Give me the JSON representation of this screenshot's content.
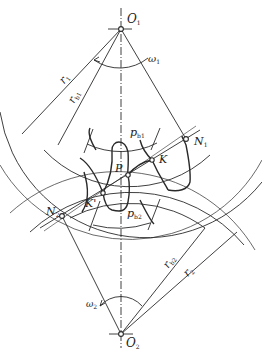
{
  "diagram": {
    "points": {
      "O1": {
        "label": "O",
        "sub": "1"
      },
      "O2": {
        "label": "O",
        "sub": "2"
      },
      "P": {
        "label": "P"
      },
      "K": {
        "label": "K"
      },
      "K_prime": {
        "label": "K'"
      },
      "N1": {
        "label": "N",
        "sub": "1"
      },
      "N2": {
        "label": "N",
        "sub": "2"
      }
    },
    "dimensions": {
      "r1": {
        "label": "r",
        "sub": "1"
      },
      "rb1": {
        "label": "r",
        "sub": "b1"
      },
      "pb1": {
        "label": "p",
        "sub": "b1"
      },
      "pb2": {
        "label": "p",
        "sub": "b2"
      },
      "rb2": {
        "label": "r",
        "sub": "b2"
      },
      "r2": {
        "label": "r",
        "sub": "2"
      }
    },
    "angular_velocities": {
      "w1": {
        "label": "ω",
        "sub": "1"
      },
      "w2": {
        "label": "ω",
        "sub": "2"
      }
    },
    "colors": {
      "line": "#2a2a2a",
      "background": "#ffffff"
    }
  }
}
